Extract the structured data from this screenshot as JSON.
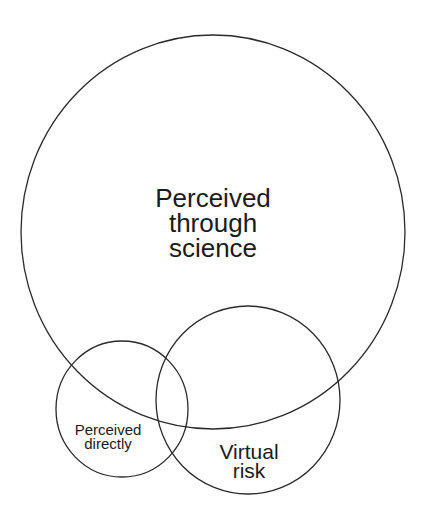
{
  "diagram": {
    "type": "venn",
    "background": "#ffffff",
    "stroke_color": "#2a2a2a",
    "text_color": "#1a1a1a",
    "sets": [
      {
        "id": "science",
        "lines": [
          "Perceived",
          "through",
          "science"
        ],
        "shape": {
          "cx": 213,
          "cy": 232,
          "rx": 192,
          "ry": 197
        }
      },
      {
        "id": "directly",
        "lines": [
          "Perceived",
          "directly"
        ],
        "shape": {
          "cx": 122,
          "cy": 409,
          "rx": 66,
          "ry": 68
        }
      },
      {
        "id": "virtual",
        "lines": [
          "Virtual",
          "risk"
        ],
        "shape": {
          "cx": 248,
          "cy": 400,
          "rx": 92,
          "ry": 94
        }
      }
    ]
  }
}
